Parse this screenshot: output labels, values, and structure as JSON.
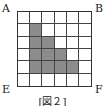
{
  "figure": {
    "labels": {
      "A": "A",
      "B": "B",
      "E": "E",
      "F": "F"
    },
    "caption": "[図２]",
    "grid": {
      "rows": 6,
      "cols": 6,
      "shaded_color": "#8c8c8c",
      "shaded_cells": [
        [
          1,
          1
        ],
        [
          2,
          1
        ],
        [
          2,
          2
        ],
        [
          3,
          1
        ],
        [
          3,
          2
        ],
        [
          3,
          3
        ],
        [
          4,
          1
        ],
        [
          4,
          2
        ],
        [
          4,
          3
        ],
        [
          4,
          4
        ]
      ]
    }
  }
}
